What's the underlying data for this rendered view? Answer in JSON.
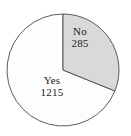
{
  "figure": {
    "background_color": "#ffffff",
    "outline_color": "#4a4a4a"
  },
  "chart_data": {
    "type": "pie",
    "title": "",
    "subtitle": "",
    "xlabel": "",
    "ylabel": "",
    "legend_position": "none",
    "labels_inside_slices": true,
    "total": 1500,
    "start_angle_deg": 0,
    "direction": "clockwise",
    "categories": [
      "Yes",
      "No"
    ],
    "values": [
      1215,
      285
    ],
    "slices": [
      {
        "name": "Yes",
        "label": "Yes",
        "value_label": "1215",
        "value": 1215,
        "percent": 81,
        "color": "#fdfdfd",
        "drawn_sweep_deg": 248
      },
      {
        "name": "No",
        "label": "No",
        "value_label": "285",
        "value": 285,
        "percent": 19,
        "color": "#d9d9d9",
        "drawn_sweep_deg": 112
      }
    ]
  },
  "geometry": {
    "center_x": 63,
    "center_y": 70,
    "radius": 56
  }
}
